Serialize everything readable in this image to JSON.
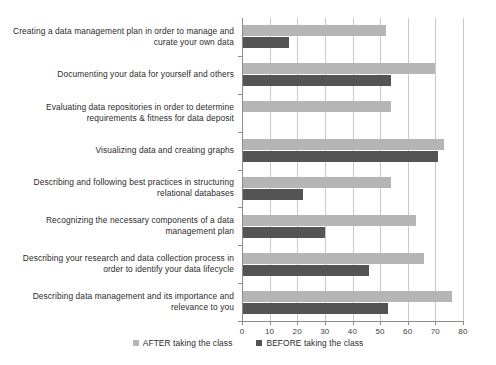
{
  "chart_data": {
    "type": "bar",
    "orientation": "horizontal",
    "title": "",
    "subtitle": "",
    "xlabel": "",
    "ylabel": "",
    "xlim": [
      0,
      80
    ],
    "xticks": [
      0,
      10,
      20,
      30,
      40,
      50,
      60,
      70,
      80
    ],
    "xtick_labels": [
      "0",
      "10",
      "20",
      "30",
      "40",
      "50",
      "60",
      "70",
      "80"
    ],
    "grid": "vertical",
    "legend_position": "bottom-center",
    "categories": [
      "Creating a data management plan in order to manage and curate your own data",
      "Documenting your data for yourself and others",
      "Evaluating data repositories in order to determine requirements & fitness for data deposit",
      "Visualizing data and creating graphs",
      "Describing and following best practices in structuring relational databases",
      "Recognizing the necessary components of a data management plan",
      "Describing your research and data collection process in order to identify your data lifecycle",
      "Describing data management and its importance and relevance to you"
    ],
    "series": [
      {
        "name": "AFTER taking the class",
        "color": "#b5b5b5",
        "values": [
          52,
          70,
          54,
          73,
          54,
          63,
          66,
          76
        ]
      },
      {
        "name": "BEFORE taking the class",
        "color": "#545454",
        "values": [
          17,
          54,
          0,
          71,
          22,
          30,
          46,
          53
        ]
      }
    ]
  },
  "legend": {
    "items": [
      {
        "label": "AFTER taking the class",
        "color": "#b5b5b5"
      },
      {
        "label": "BEFORE taking the class",
        "color": "#545454"
      }
    ]
  },
  "colors": {
    "after": "#b5b5b5",
    "before": "#545454",
    "grid": "#c9c9c9",
    "axis": "#8c8c8c",
    "text": "#2b2b2b",
    "background": "#ffffff"
  }
}
